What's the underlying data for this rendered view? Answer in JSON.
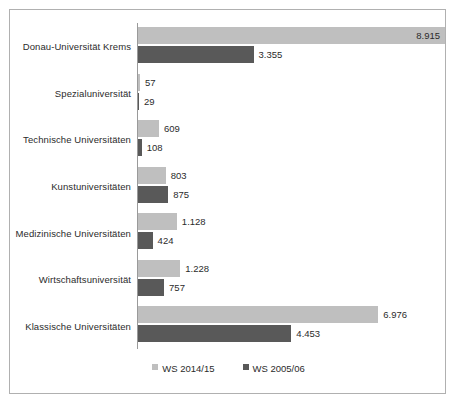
{
  "chart_data": {
    "type": "bar",
    "orientation": "horizontal",
    "title": "",
    "subtitle": "",
    "xlabel": "",
    "ylabel": "",
    "grid": false,
    "legend_position": "bottom",
    "xlim": [
      0,
      8915
    ],
    "categories": [
      "Donau-Universität Krems",
      "Spezialuniversität",
      "Technische Universitäten",
      "Kunstuniversitäten",
      "Medizinische Universitäten",
      "Wirtschaftsuniversität",
      "Klassische Universitäten"
    ],
    "series": [
      {
        "name": "WS 2014/15",
        "color": "#bfbfbf",
        "values": [
          8915,
          57,
          609,
          803,
          1128,
          1228,
          6976
        ],
        "labels": [
          "8.915",
          "57",
          "609",
          "803",
          "1.128",
          "1.228",
          "6.976"
        ]
      },
      {
        "name": "WS 2005/06",
        "color": "#595959",
        "values": [
          3355,
          29,
          108,
          875,
          424,
          757,
          4453
        ],
        "labels": [
          "3.355",
          "29",
          "108",
          "875",
          "424",
          "757",
          "4.453"
        ]
      }
    ]
  },
  "legend": {
    "items": [
      {
        "label": "WS 2014/15",
        "color": "#bfbfbf"
      },
      {
        "label": "WS 2005/06",
        "color": "#595959"
      }
    ]
  },
  "colors": {
    "series_a": "#bfbfbf",
    "series_b": "#595959",
    "axis": "#9a9a9a",
    "frame": "#b0b0b0",
    "text": "#2b2b2b",
    "background": "#ffffff"
  }
}
